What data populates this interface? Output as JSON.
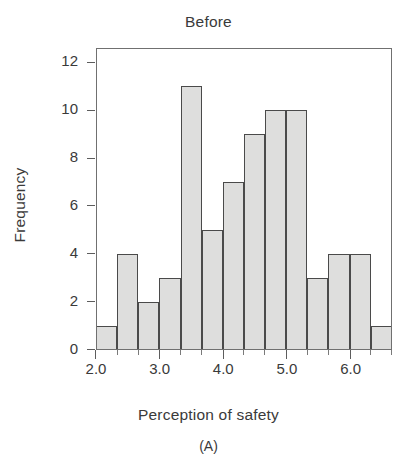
{
  "chart_data": {
    "type": "bar",
    "title": "Before",
    "caption": "(A)",
    "xlabel": "Perception of safety",
    "ylabel": "Frequency",
    "grid": false,
    "legend": null,
    "xlim": [
      2.0,
      6.65
    ],
    "ylim": [
      0,
      12.6
    ],
    "xticks": [
      2.0,
      3.0,
      4.0,
      5.0,
      6.0
    ],
    "xtick_labels": [
      "2.0",
      "3.0",
      "4.0",
      "5.0",
      "6.0"
    ],
    "yticks": [
      0,
      2,
      4,
      6,
      8,
      10,
      12
    ],
    "ytick_labels": [
      "0",
      "2",
      "4",
      "6",
      "8",
      "10",
      "12"
    ],
    "bin_width": 0.332,
    "bin_edges": [
      2.0,
      2.332,
      2.664,
      2.996,
      3.328,
      3.66,
      3.992,
      4.324,
      4.656,
      4.988,
      5.32,
      5.652,
      5.984,
      6.316,
      6.648
    ],
    "categories": [
      "2.00-2.33",
      "2.33-2.66",
      "2.66-3.00",
      "3.00-3.33",
      "3.33-3.66",
      "3.66-3.99",
      "3.99-4.32",
      "4.32-4.66",
      "4.66-4.99",
      "4.99-5.32",
      "5.32-5.65",
      "5.65-5.98",
      "5.98-6.32",
      "6.32-6.65"
    ],
    "values": [
      1,
      4,
      2,
      3,
      11,
      5,
      7,
      9,
      10,
      10,
      3,
      4,
      4,
      1
    ],
    "total_count": 74,
    "bar_fill_color": "#dededd",
    "bar_edge_color": "#4a4a4a",
    "axis_color": "#707070",
    "text_color": "#3a3a3a"
  }
}
